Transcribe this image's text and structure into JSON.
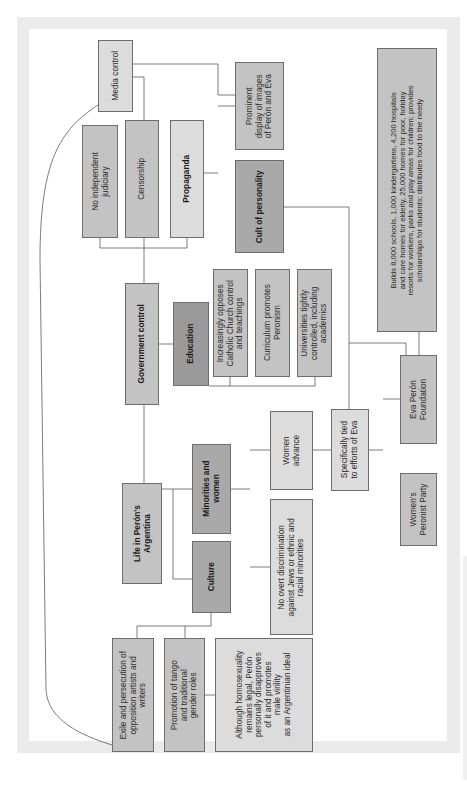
{
  "diagram": {
    "orientation": "rotated 90 degrees counter-clockwise",
    "colors": {
      "frame": "#ebebeb",
      "background": "#ffffff",
      "box_light": "#dcdcdc",
      "box_mid": "#c3c3c3",
      "box_dark": "#a9a9a9",
      "connector": "#5a5a5a"
    },
    "root": {
      "label": "Life in Perón's\nArgentina"
    },
    "branches": {
      "government_control": "Government control",
      "minorities_and_women": "Minorities and\nwomen",
      "culture": "Culture"
    },
    "government": {
      "media_control": "Media control",
      "no_independent_judiciary": "No independent\njudiciary",
      "censorship": "Censorship",
      "propaganda": "Propaganda",
      "education": "Education"
    },
    "propaganda_children": {
      "prominent_display": "Prominent\ndisplay of images\nof Perón and Eva",
      "cult_of_personality": "Cult of personality"
    },
    "education_children": {
      "opposes_church": "Increasingly opposes\nCatholic Church control\nand teachings",
      "curriculum": "Curriculum promotes\nPeronism",
      "universities": "Universities tightly\ncontrolled, including\nacademics"
    },
    "minorities": {
      "women_advance": "Women\nadvance",
      "no_discrimination": "No overt discrimination\nagainst Jews or ethnic and\nracial minorities",
      "homosexuality": "Although homosexuality\nremains legal, Perón\npersonally disapproves\nof it and promotes\nmale virility\nas an Argentinian ideal"
    },
    "eva": {
      "specifically_tied": "Specifically tied\nto efforts of Eva",
      "foundation": "Eva Perón\nFoundation",
      "womens_party": "Women's\nPeronist Party",
      "foundation_details": "Builds 8,000 schools, 1,000 kindergartens, 4,200 hospitals\nand care homes for elderly, 25,000 homes for poor, holiday\nresorts for workers, parks and play areas for children; provides\nscholarships for students; distributes food to the needy"
    },
    "culture_children": {
      "exile": "Exile and persecution of\nopposition artists and\nwriters",
      "tango": "Promotion of tango\nand traditional\ngender roles"
    }
  }
}
